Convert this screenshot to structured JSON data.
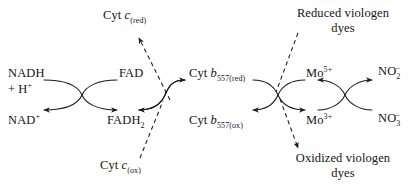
{
  "diagram": {
    "stroke_color": "#1a1a1a",
    "background": "#ffffff",
    "nodes": [
      {
        "name": "crossover-node-1",
        "x": 82,
        "y": 95
      },
      {
        "name": "crossover-node-2",
        "x": 165,
        "y": 95
      },
      {
        "name": "crossover-node-3",
        "x": 278,
        "y": 95
      },
      {
        "name": "crossover-node-4",
        "x": 345,
        "y": 95
      }
    ],
    "labels": {
      "nadh": "NADH",
      "h_plus": "+ H",
      "h_plus_charge": "+",
      "nad": "NAD",
      "nad_charge": "+",
      "fad": "FAD",
      "fadh2": "FADH",
      "fadh2_sub": "2",
      "cyt_c_red_prefix": "Cyt ",
      "cyt_c_red_italic": "c",
      "cyt_c_red_sub": "(red)",
      "cyt_c_ox_prefix": "Cyt ",
      "cyt_c_ox_italic": "c",
      "cyt_c_ox_sub": "(ox)",
      "cyt_b_red_prefix": "Cyt ",
      "cyt_b_red_italic": "b",
      "cyt_b_red_sub": "557(red)",
      "cyt_b_ox_prefix": "Cyt ",
      "cyt_b_ox_italic": "b",
      "cyt_b_ox_sub": "557(ox)",
      "mo5_base": "Mo",
      "mo5_charge": "5+",
      "mo3_base": "Mo",
      "mo3_charge": "3+",
      "no2_base": "NO",
      "no2_sub": "2",
      "no2_charge": "–",
      "no3_base": "NO",
      "no3_sub": "3",
      "no3_charge": "–",
      "reduced_viologen_line1": "Reduced viologen",
      "reduced_viologen_line2": "dyes",
      "oxidized_viologen_line1": "Oxidized viologen",
      "oxidized_viologen_line2": "dyes"
    }
  }
}
